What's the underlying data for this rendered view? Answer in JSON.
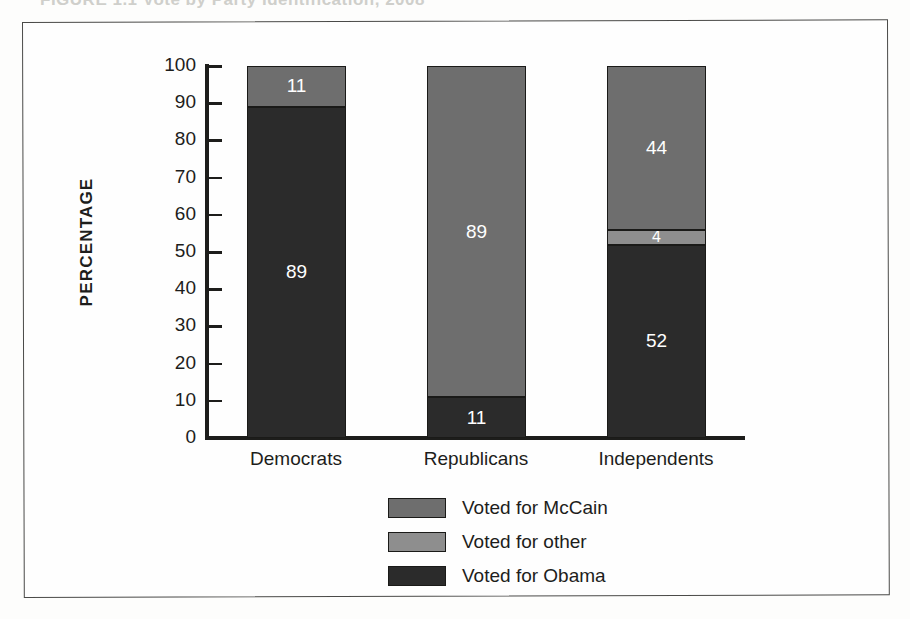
{
  "figure": {
    "caption_partial": "FIGURE 1.1  Vote by Party Identification, 2008"
  },
  "axis": {
    "y_title": "PERCENTAGE",
    "y_ticks": [
      "100",
      "90",
      "80",
      "70",
      "60",
      "50",
      "40",
      "30",
      "20",
      "10",
      "0"
    ]
  },
  "legend": {
    "items": [
      {
        "label": "Voted for McCain",
        "color": "#6e6e6e"
      },
      {
        "label": "Voted for other",
        "color": "#8e8e8e"
      },
      {
        "label": "Voted for Obama",
        "color": "#2b2b2b"
      }
    ]
  },
  "bars": [
    {
      "category": "Democrats",
      "segments": [
        {
          "series": "Voted for McCain",
          "value": 11,
          "label": "11",
          "color": "#6e6e6e"
        },
        {
          "series": "Voted for Obama",
          "value": 89,
          "label": "89",
          "color": "#2b2b2b"
        }
      ]
    },
    {
      "category": "Republicans",
      "segments": [
        {
          "series": "Voted for McCain",
          "value": 89,
          "label": "89",
          "color": "#6e6e6e"
        },
        {
          "series": "Voted for Obama",
          "value": 11,
          "label": "11",
          "color": "#2b2b2b"
        }
      ]
    },
    {
      "category": "Independents",
      "segments": [
        {
          "series": "Voted for McCain",
          "value": 44,
          "label": "44",
          "color": "#6e6e6e"
        },
        {
          "series": "Voted for other",
          "value": 4,
          "label": "4",
          "color": "#8e8e8e"
        },
        {
          "series": "Voted for Obama",
          "value": 52,
          "label": "52",
          "color": "#2b2b2b"
        }
      ]
    }
  ],
  "chart_data": {
    "type": "bar",
    "subtype": "stacked-vertical",
    "title": "",
    "xlabel": "",
    "ylabel": "PERCENTAGE",
    "ylim": [
      0,
      100
    ],
    "ytick_step": 10,
    "yticks": [
      0,
      10,
      20,
      30,
      40,
      50,
      60,
      70,
      80,
      90,
      100
    ],
    "grid": false,
    "legend_position": "bottom-center",
    "categories": [
      "Democrats",
      "Republicans",
      "Independents"
    ],
    "series": [
      {
        "name": "Voted for Obama",
        "color": "#2b2b2b",
        "values": [
          89,
          11,
          52
        ]
      },
      {
        "name": "Voted for other",
        "color": "#8e8e8e",
        "values": [
          0,
          0,
          4
        ]
      },
      {
        "name": "Voted for McCain",
        "color": "#6e6e6e",
        "values": [
          11,
          89,
          44
        ]
      }
    ],
    "data_labels": {
      "Democrats": {
        "Voted for Obama": "89",
        "Voted for McCain": "11"
      },
      "Republicans": {
        "Voted for Obama": "11",
        "Voted for McCain": "89"
      },
      "Independents": {
        "Voted for Obama": "52",
        "Voted for other": "4",
        "Voted for McCain": "44"
      }
    }
  }
}
